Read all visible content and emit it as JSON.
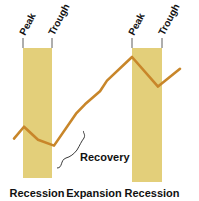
{
  "diagram": {
    "colors": {
      "recession_band": "#e3cf7a",
      "cycle_line": "#c8862a",
      "text": "#111111",
      "bracket": "#222222"
    },
    "bands": [
      {
        "name": "recession-1",
        "peak_label": "Peak",
        "trough_label": "Trough"
      },
      {
        "name": "recession-2",
        "peak_label": "Peak",
        "trough_label": "Trough"
      }
    ],
    "annotation": {
      "label": "Recovery"
    },
    "phases": [
      "Recession",
      "Expansion",
      "Recession"
    ]
  },
  "chart_data": {
    "type": "line",
    "title": "",
    "xlabel": "",
    "ylabel": "",
    "x": [
      0,
      1,
      2,
      3,
      4,
      5,
      6,
      7,
      8,
      9,
      10
    ],
    "values": [
      3.0,
      4.0,
      2.9,
      2.4,
      5.1,
      5.9,
      7.0,
      7.9,
      9.9,
      7.4,
      8.9
    ],
    "recession_intervals": [
      [
        1,
        3
      ],
      [
        8,
        9.8
      ]
    ],
    "phase_labels": [
      "Recession",
      "Expansion",
      "Recession"
    ],
    "ylim": [
      0,
      11
    ]
  }
}
